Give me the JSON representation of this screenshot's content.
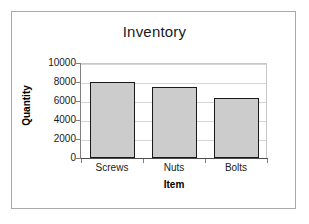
{
  "chart_data": {
    "type": "bar",
    "title": "Inventory",
    "xlabel": "Item",
    "ylabel": "Quantity",
    "categories": [
      "Screws",
      "Nuts",
      "Bolts"
    ],
    "values": [
      8000,
      7500,
      6300
    ],
    "ylim": [
      0,
      10000
    ],
    "ytick_labels": [
      "10000",
      "8000",
      "6000",
      "4000",
      "2000",
      "0"
    ],
    "ytick_values": [
      10000,
      8000,
      6000,
      4000,
      2000,
      0
    ],
    "grid": true,
    "legend": false,
    "legend_position": "none",
    "bar_fill_color": "#cccccc",
    "bar_border_color": "#1a1a1a",
    "plot_background_color": "#ffffff",
    "gridline_color": "#d6d6d6",
    "frame_border_color": "#a9a9a9"
  }
}
